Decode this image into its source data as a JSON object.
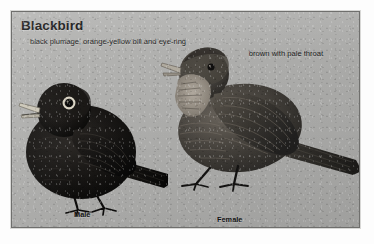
{
  "plate": {
    "title": "Blackbird",
    "background_color": "#b2b2b0",
    "frame_color": "#6f6f6d",
    "captions": {
      "male": "black plumage, orange-yellow bill and eye-ring",
      "female": "brown with pale throat"
    },
    "figures": [
      {
        "name": "male-blackbird",
        "label": "Male",
        "description": "black plumage, orange-yellow bill and eye-ring",
        "plumage_color": "#141414",
        "bill_color": "#cfcabb",
        "eye_ring_color": "#d8d3c4"
      },
      {
        "name": "female-blackbird",
        "label": "Female",
        "description": "brown with pale throat",
        "plumage_color": "#4a4641",
        "throat_color": "#a9a298",
        "bill_color": "#b3ada1"
      }
    ]
  }
}
